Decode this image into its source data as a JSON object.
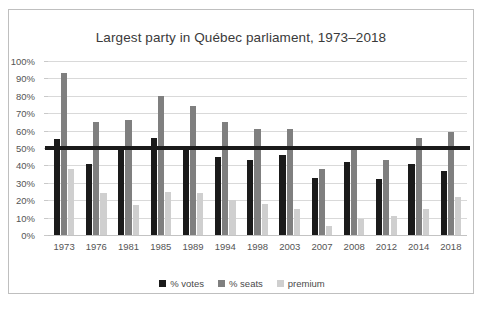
{
  "chart_data": {
    "type": "bar",
    "title": "Largest party in Québec parliament, 1973–2018",
    "xlabel": "",
    "ylabel": "",
    "ylim": [
      0,
      100
    ],
    "ytick_labels": [
      "100%",
      "90%",
      "80%",
      "70%",
      "60%",
      "50%",
      "40%",
      "30%",
      "20%",
      "10%",
      "0%"
    ],
    "ytick_values": [
      100,
      90,
      80,
      70,
      60,
      50,
      40,
      30,
      20,
      10,
      0
    ],
    "grid": true,
    "legend_position": "bottom",
    "reference_line": {
      "value": 50,
      "label": "",
      "color": "#1a1a1a"
    },
    "categories": [
      "1973",
      "1976",
      "1981",
      "1985",
      "1989",
      "1994",
      "1998",
      "2003",
      "2007",
      "2008",
      "2012",
      "2014",
      "2018"
    ],
    "series": [
      {
        "name": "% votes",
        "color": "#1a1a1a",
        "values": [
          55,
          41,
          49,
          56,
          50,
          45,
          43,
          46,
          33,
          42,
          32,
          41,
          37
        ]
      },
      {
        "name": "% seats",
        "color": "#7f7f7f",
        "values": [
          93,
          65,
          66,
          80,
          74,
          65,
          61,
          61,
          38,
          51,
          43,
          56,
          59
        ]
      },
      {
        "name": "premium",
        "color": "#cfcfcf",
        "values": [
          38,
          24,
          17,
          25,
          24,
          20,
          18,
          15,
          5,
          9,
          11,
          15,
          22
        ]
      }
    ]
  },
  "legend": {
    "items": [
      {
        "label": "% votes",
        "color": "#1a1a1a"
      },
      {
        "label": "% seats",
        "color": "#7f7f7f"
      },
      {
        "label": "premium",
        "color": "#cfcfcf"
      }
    ]
  }
}
